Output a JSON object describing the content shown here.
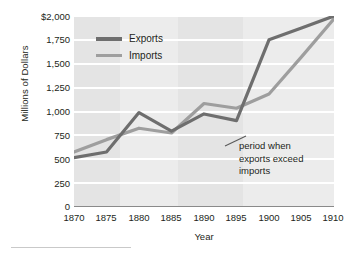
{
  "chart_data": {
    "type": "line",
    "title": "",
    "xlabel": "Year",
    "ylabel": "Millions of Dollars",
    "x": [
      1870,
      1875,
      1880,
      1885,
      1890,
      1895,
      1900,
      1905,
      1910
    ],
    "xlim": [
      1870,
      1910
    ],
    "ylim": [
      0,
      2000
    ],
    "xticks": [
      "1870",
      "1875",
      "1880",
      "1885",
      "1890",
      "1895",
      "1900",
      "1905",
      "1910"
    ],
    "yticks": [
      "$2,000",
      "1,750",
      "1,500",
      "1,250",
      "1,000",
      "750",
      "500",
      "250",
      "0"
    ],
    "ytick_values": [
      2000,
      1750,
      1500,
      1250,
      1000,
      750,
      500,
      250,
      0
    ],
    "grid": "horizontal-white-gridlines-on-gray-panel",
    "legend_position": "upper-left-inside",
    "series": [
      {
        "name": "Exports",
        "color": "#6e6e6e",
        "values": [
          510,
          570,
          985,
          790,
          970,
          900,
          1750,
          1875,
          2000
        ]
      },
      {
        "name": "Imports",
        "color": "#9e9e9e",
        "values": [
          570,
          700,
          820,
          770,
          1080,
          1030,
          1180,
          1570,
          1970
        ]
      }
    ],
    "annotations": [
      {
        "name": "exports-exceed-imports-note",
        "lines": [
          "period when",
          "exports exceed",
          "imports"
        ],
        "leader_from_x": 1893,
        "leader_from_y": 640
      }
    ],
    "bands": [
      {
        "from": 1870,
        "to": 1877,
        "shade": "dark"
      },
      {
        "from": 1877,
        "to": 1886,
        "shade": "light"
      },
      {
        "from": 1886,
        "to": 1896,
        "shade": "dark"
      },
      {
        "from": 1896,
        "to": 1910,
        "shade": "light"
      }
    ]
  },
  "colors": {
    "panel": "#e4e4e4",
    "panel_light": "#ececec",
    "gridline": "#ffffff",
    "axis": "#8a8a8a",
    "text": "#231f20",
    "exports": "#6e6e6e",
    "imports": "#9e9e9e",
    "rule": "#c9c9c9"
  }
}
